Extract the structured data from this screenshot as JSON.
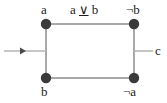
{
  "diagram": {
    "type": "graph",
    "title": "",
    "canvas": {
      "width": 167,
      "height": 103,
      "background": "#ffffff"
    },
    "colors": {
      "node_fill": "#3a3a3a",
      "edge_stroke": "#a9a9a9",
      "text": "#1a1a1a",
      "arrow_fill": "#4a4a4a"
    },
    "nodes": [
      {
        "id": "n-top-left",
        "label": "a",
        "x": 46,
        "y": 24,
        "radius": 5
      },
      {
        "id": "n-top-right",
        "label": "¬b",
        "x": 134,
        "y": 24,
        "radius": 5
      },
      {
        "id": "n-bottom-left",
        "label": "b",
        "x": 46,
        "y": 78,
        "radius": 5
      },
      {
        "id": "n-bottom-right",
        "label": "¬a",
        "x": 134,
        "y": 78,
        "radius": 5
      }
    ],
    "edges": [
      {
        "id": "edge-top",
        "from": "n-top-left",
        "to": "n-top-right",
        "label": "a ∨ b",
        "label_operator": "∨",
        "label_left": "a",
        "label_right": "b"
      },
      {
        "id": "edge-left",
        "from": "n-top-left",
        "to": "n-bottom-left",
        "label": ""
      },
      {
        "id": "edge-right",
        "from": "n-top-right",
        "to": "n-bottom-right",
        "label": ""
      },
      {
        "id": "edge-bottom",
        "from": "n-bottom-left",
        "to": "n-bottom-right",
        "label": ""
      }
    ],
    "connectors": [
      {
        "id": "input-arrow",
        "kind": "incoming",
        "x1": 4,
        "y1": 51,
        "x2": 46,
        "y2": 51,
        "arrowhead_x": 23,
        "label": ""
      },
      {
        "id": "output-stub",
        "kind": "outgoing",
        "x1": 134,
        "y1": 51,
        "x2": 153,
        "y2": 51,
        "label": "c"
      }
    ],
    "labels": {
      "top_left_node": "a",
      "top_right_node": "¬b",
      "bottom_left_node": "b",
      "bottom_right_node": "¬a",
      "top_edge": "a ∨ b",
      "top_edge_operand_left": "a",
      "top_edge_operator": "∨",
      "top_edge_operand_right": "b",
      "right_output": "c"
    }
  }
}
